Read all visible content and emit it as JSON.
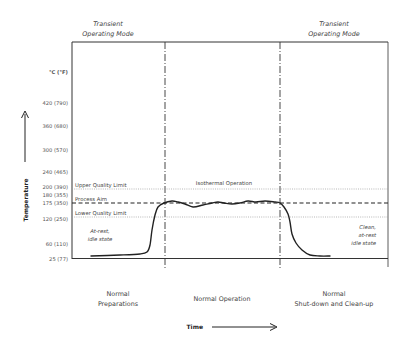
{
  "chart_data": {
    "type": "line",
    "title": "",
    "xlabel": "Time",
    "ylabel": "Temperature",
    "y_unit_label": "°C (°F)",
    "y_ticks": [
      {
        "label": "420 (790)",
        "value": 420,
        "y": 103
      },
      {
        "label": "360 (680)",
        "value": 360,
        "y": 126
      },
      {
        "label": "300 (570)",
        "value": 300,
        "y": 150
      },
      {
        "label": "240 (465)",
        "value": 240,
        "y": 172
      },
      {
        "label": "200 (390)",
        "value": 200,
        "y": 187
      },
      {
        "label": "180 (355)",
        "value": 180,
        "y": 195
      },
      {
        "label": "175 (350)",
        "value": 175,
        "y": 203
      },
      {
        "label": "120 (250)",
        "value": 120,
        "y": 219
      },
      {
        "label": "60 (110)",
        "value": 60,
        "y": 244
      },
      {
        "label": "25 (77)",
        "value": 25,
        "y": 258
      }
    ],
    "reference_lines": [
      {
        "name": "Upper Quality Limit",
        "value": 200,
        "style": "dotted",
        "y": 189
      },
      {
        "name": "Process Aim",
        "value": 175,
        "style": "dashed",
        "y": 203
      },
      {
        "name": "Lower Quality Limit",
        "value": 120,
        "style": "dotted",
        "y": 217
      }
    ],
    "phases": [
      {
        "label_line1": "Normal",
        "label_line2": "Preparations",
        "x_start": 72,
        "x_end": 165
      },
      {
        "label_line1": "",
        "label_line2": "Normal Operation",
        "x_start": 165,
        "x_end": 280
      },
      {
        "label_line1": "Normal",
        "label_line2": "Shut-down and Clean-up",
        "x_start": 280,
        "x_end": 388
      }
    ],
    "modes": [
      {
        "line1": "Transient",
        "line2": "Operating Mode",
        "x": 108
      },
      {
        "line1": "Transient",
        "line2": "Operating Mode",
        "x": 334
      }
    ],
    "annotations": [
      {
        "text": [
          "At-rest,",
          "idle state"
        ],
        "x": 100,
        "y": 235
      },
      {
        "text": [
          "Isothermal Operation"
        ],
        "x": 224,
        "y": 184
      },
      {
        "text": [
          "Clean,",
          "at-rest",
          "idle state"
        ],
        "x": 376,
        "y": 228
      }
    ],
    "series": [
      {
        "name": "Temperature profile",
        "points": [
          [
            91,
            256
          ],
          [
            120,
            255
          ],
          [
            140,
            254
          ],
          [
            147,
            252
          ],
          [
            150,
            245
          ],
          [
            152,
            230
          ],
          [
            155,
            215
          ],
          [
            158,
            207
          ],
          [
            164,
            203
          ],
          [
            172,
            201
          ],
          [
            178,
            202
          ],
          [
            185,
            204
          ],
          [
            193,
            207
          ],
          [
            203,
            205
          ],
          [
            212,
            203
          ],
          [
            218,
            202
          ],
          [
            224,
            203
          ],
          [
            232,
            204
          ],
          [
            240,
            203
          ],
          [
            248,
            201
          ],
          [
            256,
            202
          ],
          [
            265,
            201
          ],
          [
            275,
            202
          ],
          [
            280,
            203
          ],
          [
            284,
            207
          ],
          [
            288,
            214
          ],
          [
            290,
            222
          ],
          [
            292,
            234
          ],
          [
            296,
            243
          ],
          [
            302,
            250
          ],
          [
            310,
            255
          ],
          [
            320,
            256
          ],
          [
            330,
            256
          ]
        ]
      }
    ],
    "plot_box": {
      "left": 72,
      "top": 42,
      "right": 388,
      "bottom": 258
    },
    "phase_dividers_x": [
      165,
      280
    ]
  },
  "labels": {
    "mode_left_1": "Transient",
    "mode_left_2": "Operating Mode",
    "mode_right_1": "Transient",
    "mode_right_2": "Operating Mode",
    "y_unit": "°C (°F)",
    "y_axis_title": "Temperature",
    "x_axis_title": "Time",
    "upper_limit": "Upper Quality Limit",
    "process_aim": "Process Aim",
    "lower_limit": "Lower Quality Limit",
    "isothermal": "Isothermal Operation",
    "at_rest_1": "At-rest,",
    "at_rest_2": "idle state",
    "clean_1": "Clean,",
    "clean_2": "at-rest",
    "clean_3": "idle state",
    "phase1_1": "Normal",
    "phase1_2": "Preparations",
    "phase2": "Normal Operation",
    "phase3_1": "Normal",
    "phase3_2": "Shut-down and Clean-up",
    "ticks": [
      "420 (790)",
      "360 (680)",
      "300 (570)",
      "240 (465)",
      "200 (390)",
      "180 (355)",
      "175 (350)",
      "120 (250)",
      "60 (110)",
      "25 (77)"
    ]
  }
}
